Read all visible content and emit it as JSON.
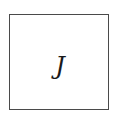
{
  "diagram": {
    "node": {
      "label": "J",
      "shape": "square",
      "border_color": "#4a4a4a",
      "fill_color": "#ffffff",
      "text_color": "#1a1a1a"
    }
  }
}
